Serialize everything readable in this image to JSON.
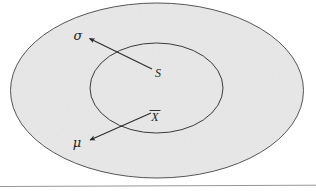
{
  "figure": {
    "background_color": "#ffffff",
    "outer_region": {
      "name": "population-region",
      "fill_color": "#e7e7e7",
      "stroke_color": "#555555",
      "cx": 157,
      "cy": 90.5,
      "rx": 146.5,
      "ry": 87.5
    },
    "inner_region": {
      "name": "sample-region",
      "fill_color": "none",
      "stroke_color": "#3a3a3a",
      "cx": 156.5,
      "cy": 88,
      "rx": 66.5,
      "ry": 45
    },
    "baseline_rule": {
      "color": "#8a8a8a",
      "y": 186
    },
    "labels": [
      {
        "id": "sigma",
        "text": "σ",
        "x": 78,
        "y": 40,
        "font_size": 13,
        "kind": "parameter"
      },
      {
        "id": "s",
        "text": "S",
        "x": 158,
        "y": 77,
        "font_size": 12,
        "kind": "statistic"
      },
      {
        "id": "xbar",
        "text": "X",
        "overbar": true,
        "x": 155,
        "y": 121,
        "font_size": 12,
        "kind": "statistic"
      },
      {
        "id": "mu",
        "text": "μ",
        "x": 77,
        "y": 147,
        "font_size": 13,
        "kind": "parameter"
      }
    ],
    "arrows": [
      {
        "id": "s-to-sigma",
        "from_label": "S",
        "to_label": "σ",
        "x1": 152,
        "y1": 69,
        "x2": 89.5,
        "y2": 38.5,
        "color": "#2a2a2a"
      },
      {
        "id": "xbar-to-mu",
        "from_label": "X̄",
        "to_label": "μ",
        "x1": 151,
        "y1": 113,
        "x2": 90,
        "y2": 140,
        "color": "#2a2a2a"
      }
    ]
  }
}
